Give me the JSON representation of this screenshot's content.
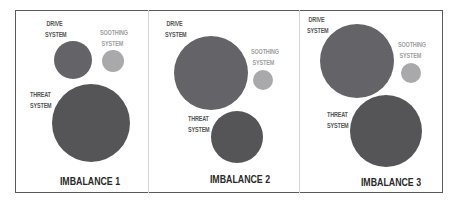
{
  "colors": {
    "drive": "#646468",
    "threat": "#555558",
    "soothing": "#a9a9ab",
    "label_dark": "#555555",
    "label_light": "#a0a0a0",
    "caption": "#2a2a2a",
    "frame": "#5a5a5a",
    "divider": "#d6d6d6"
  },
  "labels": {
    "drive_line1": "DRIVE",
    "drive_line2": "SYSTEM",
    "soothing_line1": "SOOTHING",
    "soothing_line2": "SYSTEM",
    "threat_line1": "THREAT",
    "threat_line2": "SYSTEM"
  },
  "panels": [
    {
      "caption": "IMBALANCE 1",
      "drive": {
        "cx": 73,
        "cy": 60,
        "r": 19
      },
      "soothing": {
        "cx": 113,
        "cy": 61,
        "r": 11
      },
      "threat": {
        "cx": 91,
        "cy": 123,
        "r": 39
      }
    },
    {
      "caption": "IMBALANCE 2",
      "drive": {
        "cx": 211,
        "cy": 73,
        "r": 37
      },
      "soothing": {
        "cx": 263,
        "cy": 80,
        "r": 10
      },
      "threat": {
        "cx": 237,
        "cy": 137,
        "r": 26
      }
    },
    {
      "caption": "IMBALANCE 3",
      "drive": {
        "cx": 357,
        "cy": 61,
        "r": 37
      },
      "soothing": {
        "cx": 411,
        "cy": 73,
        "r": 10
      },
      "threat": {
        "cx": 386,
        "cy": 131,
        "r": 36
      }
    }
  ]
}
